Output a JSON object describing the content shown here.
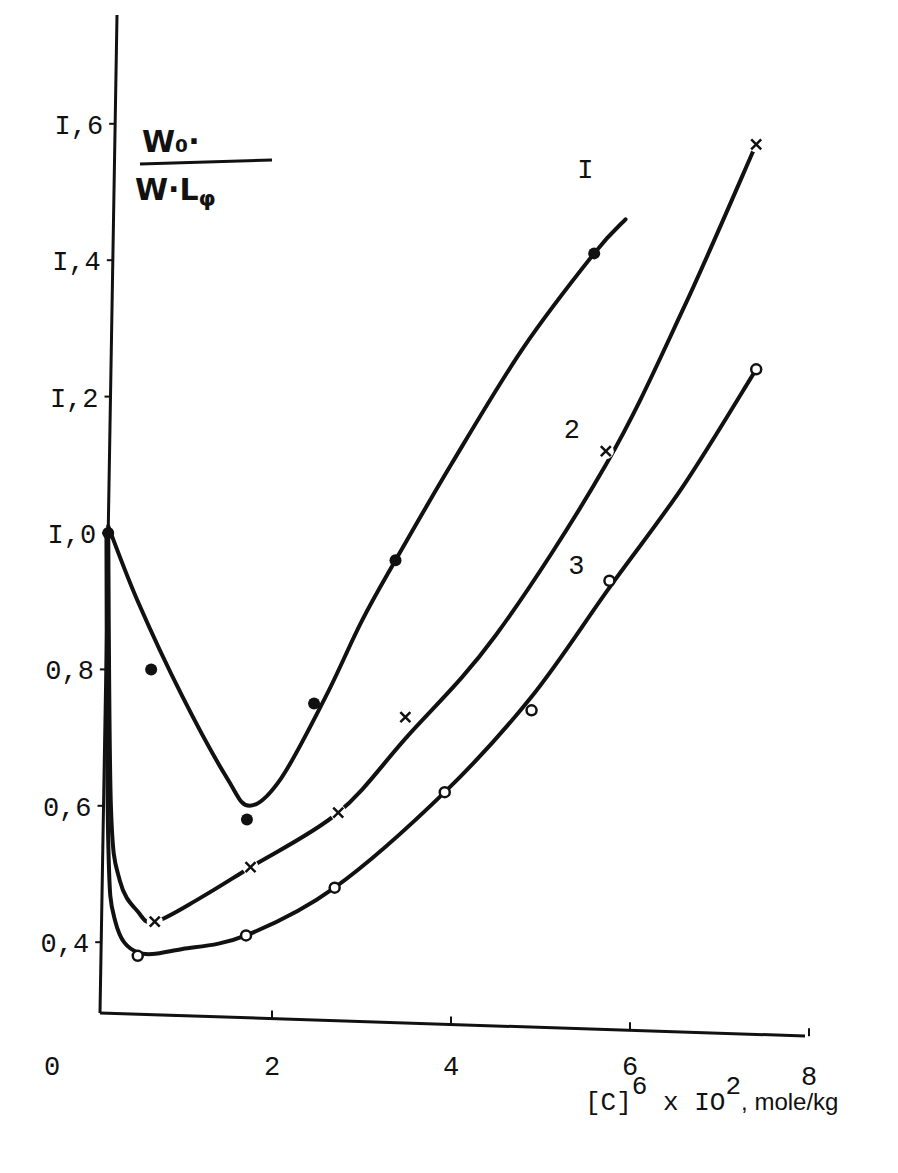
{
  "chart_data": {
    "type": "line",
    "title": "",
    "ylabel": {
      "numerator": "W₀·",
      "denominator": "W·L_φ"
    },
    "xlabel": {
      "main": "[C]",
      "sup1": "6",
      "mid": " x IO",
      "sup2": "2",
      "unit": ", mole/kg"
    },
    "xlim": [
      0,
      8
    ],
    "ylim": [
      0.3,
      1.7
    ],
    "x_ticks": [
      2,
      4,
      6,
      8
    ],
    "x_tick_labels": [
      "0",
      "2",
      "4",
      "6",
      "8"
    ],
    "y_ticks": [
      0.4,
      0.6,
      0.8,
      1.0,
      1.2,
      1.4,
      1.6
    ],
    "y_tick_labels": [
      "0,4",
      "0,6",
      "0,8",
      "I,0",
      "I,2",
      "I,4",
      "I,6"
    ],
    "grid": false,
    "series": [
      {
        "name": "I",
        "marker": "filled-dot",
        "points": [
          [
            0.17,
            1.0
          ],
          [
            0.65,
            0.8
          ],
          [
            1.72,
            0.58
          ],
          [
            2.47,
            0.75
          ],
          [
            3.38,
            0.96
          ],
          [
            5.6,
            1.41
          ]
        ],
        "curve": [
          [
            0.17,
            1.01
          ],
          [
            0.5,
            0.9
          ],
          [
            1.0,
            0.76
          ],
          [
            1.5,
            0.64
          ],
          [
            1.75,
            0.6
          ],
          [
            2.1,
            0.64
          ],
          [
            2.6,
            0.76
          ],
          [
            3.0,
            0.87
          ],
          [
            3.38,
            0.96
          ],
          [
            4.0,
            1.1
          ],
          [
            4.8,
            1.27
          ],
          [
            5.6,
            1.41
          ],
          [
            5.95,
            1.46
          ]
        ]
      },
      {
        "name": "2",
        "marker": "cross",
        "points": [
          [
            0.69,
            0.43
          ],
          [
            1.76,
            0.51
          ],
          [
            2.74,
            0.59
          ],
          [
            3.49,
            0.73
          ],
          [
            5.73,
            1.12
          ],
          [
            7.41,
            1.57
          ]
        ],
        "curve": [
          [
            0.17,
            1.0
          ],
          [
            0.2,
            0.6
          ],
          [
            0.3,
            0.49
          ],
          [
            0.5,
            0.445
          ],
          [
            0.69,
            0.43
          ],
          [
            1.2,
            0.465
          ],
          [
            1.76,
            0.51
          ],
          [
            2.74,
            0.59
          ],
          [
            3.5,
            0.7
          ],
          [
            4.5,
            0.85
          ],
          [
            5.73,
            1.1
          ],
          [
            6.6,
            1.33
          ],
          [
            7.41,
            1.57
          ]
        ]
      },
      {
        "name": "3",
        "marker": "open-circle",
        "points": [
          [
            0.5,
            0.38
          ],
          [
            1.71,
            0.41
          ],
          [
            2.7,
            0.48
          ],
          [
            3.93,
            0.62
          ],
          [
            4.9,
            0.74
          ],
          [
            5.77,
            0.93
          ],
          [
            7.41,
            1.24
          ]
        ],
        "curve": [
          [
            0.15,
            1.0
          ],
          [
            0.17,
            0.55
          ],
          [
            0.25,
            0.43
          ],
          [
            0.5,
            0.385
          ],
          [
            1.0,
            0.39
          ],
          [
            1.71,
            0.41
          ],
          [
            2.7,
            0.48
          ],
          [
            3.93,
            0.62
          ],
          [
            4.9,
            0.76
          ],
          [
            5.77,
            0.92
          ],
          [
            6.6,
            1.07
          ],
          [
            7.41,
            1.24
          ]
        ]
      }
    ],
    "curve_labels": [
      {
        "text": "I",
        "x": 5.5,
        "y": 1.52
      },
      {
        "text": "2",
        "x": 5.35,
        "y": 1.14
      },
      {
        "text": "3",
        "x": 5.4,
        "y": 0.94
      }
    ]
  }
}
